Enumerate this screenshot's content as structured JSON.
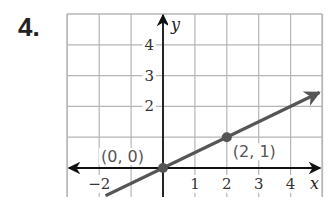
{
  "problem": {
    "number": "4."
  },
  "chart_data": {
    "type": "line",
    "title": "",
    "xlabel": "x",
    "ylabel": "y",
    "xlim": [
      -3,
      5
    ],
    "ylim": [
      -1,
      5
    ],
    "grid": true,
    "x_ticks": [
      {
        "value": -2,
        "label": "−2"
      },
      {
        "value": 1,
        "label": "1"
      },
      {
        "value": 2,
        "label": "2"
      },
      {
        "value": 3,
        "label": "3"
      },
      {
        "value": 4,
        "label": "4"
      }
    ],
    "y_ticks": [
      {
        "value": 2,
        "label": "2"
      },
      {
        "value": 3,
        "label": "3"
      },
      {
        "value": 4,
        "label": "4"
      }
    ],
    "series": [
      {
        "name": "y = 0.5x",
        "slope": 0.5,
        "intercept": 0,
        "color": "#555555",
        "points": [
          {
            "x": 0,
            "y": 0,
            "label": "(0, 0)"
          },
          {
            "x": 2,
            "y": 1,
            "label": "(2, 1)"
          }
        ]
      }
    ]
  }
}
